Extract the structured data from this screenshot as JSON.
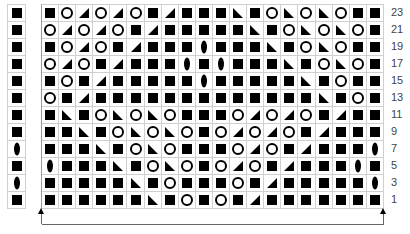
{
  "legend_symbols": {
    "S": "filled-square",
    "O": "circle",
    "R": "triangle-right-lean",
    "L": "triangle-left-lean",
    "D": "lens-oval"
  },
  "side_column": [
    "S",
    "S",
    "S",
    "S",
    "S",
    "S",
    "S",
    "S",
    "D",
    "S",
    "D",
    "S"
  ],
  "grid_rows": [
    [
      "S",
      "O",
      "R",
      "O",
      "R",
      "O",
      "S",
      "R",
      "S",
      "S",
      "S",
      "L",
      "S",
      "O",
      "L",
      "O",
      "L",
      "O",
      "S",
      "S"
    ],
    [
      "O",
      "R",
      "O",
      "R",
      "O",
      "S",
      "R",
      "S",
      "S",
      "S",
      "S",
      "S",
      "L",
      "S",
      "O",
      "L",
      "O",
      "L",
      "O",
      "S"
    ],
    [
      "S",
      "O",
      "R",
      "O",
      "S",
      "R",
      "S",
      "S",
      "S",
      "D",
      "S",
      "S",
      "S",
      "L",
      "S",
      "O",
      "L",
      "O",
      "S",
      "S"
    ],
    [
      "O",
      "R",
      "O",
      "S",
      "R",
      "S",
      "S",
      "S",
      "D",
      "S",
      "D",
      "S",
      "S",
      "S",
      "L",
      "S",
      "O",
      "L",
      "O",
      "S"
    ],
    [
      "S",
      "O",
      "S",
      "R",
      "S",
      "S",
      "S",
      "S",
      "S",
      "D",
      "S",
      "S",
      "S",
      "S",
      "S",
      "L",
      "S",
      "O",
      "S",
      "S"
    ],
    [
      "O",
      "S",
      "R",
      "S",
      "S",
      "S",
      "S",
      "S",
      "S",
      "S",
      "S",
      "S",
      "S",
      "S",
      "S",
      "S",
      "L",
      "S",
      "O",
      "S"
    ],
    [
      "S",
      "L",
      "S",
      "O",
      "L",
      "O",
      "L",
      "O",
      "S",
      "S",
      "S",
      "O",
      "R",
      "O",
      "R",
      "O",
      "S",
      "R",
      "S",
      "S"
    ],
    [
      "S",
      "S",
      "L",
      "S",
      "O",
      "L",
      "O",
      "L",
      "O",
      "S",
      "O",
      "R",
      "O",
      "R",
      "O",
      "S",
      "R",
      "S",
      "S",
      "S"
    ],
    [
      "S",
      "S",
      "S",
      "L",
      "S",
      "O",
      "L",
      "O",
      "S",
      "S",
      "S",
      "O",
      "R",
      "O",
      "S",
      "R",
      "S",
      "S",
      "S",
      "D"
    ],
    [
      "D",
      "S",
      "S",
      "S",
      "L",
      "S",
      "O",
      "L",
      "O",
      "S",
      "O",
      "R",
      "O",
      "S",
      "R",
      "S",
      "S",
      "S",
      "D",
      "S"
    ],
    [
      "S",
      "S",
      "S",
      "S",
      "S",
      "L",
      "S",
      "O",
      "S",
      "S",
      "S",
      "O",
      "S",
      "R",
      "S",
      "S",
      "S",
      "S",
      "S",
      "D"
    ],
    [
      "S",
      "S",
      "S",
      "S",
      "S",
      "S",
      "L",
      "S",
      "O",
      "S",
      "O",
      "S",
      "R",
      "S",
      "S",
      "S",
      "S",
      "S",
      "S",
      "S"
    ]
  ],
  "row_labels": [
    "23",
    "21",
    "19",
    "17",
    "15",
    "13",
    "11",
    "9",
    "7",
    "5",
    "3",
    "1"
  ],
  "repeat_bracket": {
    "left_arrow": "up-arrow",
    "right_arrow": "up-arrow"
  }
}
